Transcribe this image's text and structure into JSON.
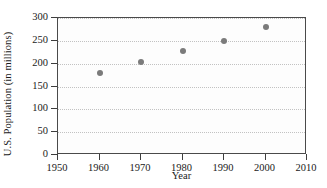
{
  "chart_data": {
    "type": "scatter",
    "title": "",
    "xlabel": "Year",
    "ylabel": "U.S. Population (in millions)",
    "xlim": [
      1950,
      2010
    ],
    "ylim": [
      0,
      300
    ],
    "xticks": [
      1950,
      1960,
      1970,
      1980,
      1990,
      2000,
      2010
    ],
    "xtick_labels": [
      "1950",
      "1960",
      "1970",
      "1980",
      "1990",
      "2000",
      "2010"
    ],
    "yticks": [
      0,
      50,
      100,
      150,
      200,
      250,
      300
    ],
    "ytick_labels": [
      "0",
      "50",
      "100",
      "150",
      "200",
      "250",
      "300"
    ],
    "grid": "horizontal-dotted",
    "legend": "none",
    "marker_color": "#7b7b7b",
    "frame_color": "#4a4a4a",
    "grid_color": "#c2c2c2",
    "x": [
      1960,
      1970,
      1980,
      1990,
      2000
    ],
    "y": [
      179,
      203,
      227,
      249,
      281
    ],
    "points": [
      {
        "year": 1960,
        "population": 179
      },
      {
        "year": 1970,
        "population": 203
      },
      {
        "year": 1980,
        "population": 227
      },
      {
        "year": 1990,
        "population": 249
      },
      {
        "year": 2000,
        "population": 281
      }
    ]
  }
}
